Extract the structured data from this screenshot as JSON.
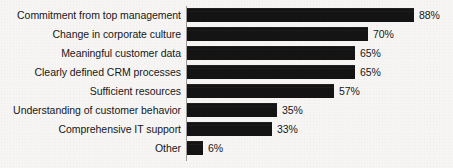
{
  "chart": {
    "title": "",
    "background_color": "#f6f5f3",
    "bar_color": "#141414",
    "text_color": "#17171a",
    "axis_color": "#9b9a98"
  },
  "chart_data": {
    "type": "bar",
    "orientation": "horizontal",
    "title": "",
    "subtitle": "",
    "xlabel": "",
    "ylabel": "",
    "xlim": [
      0,
      100
    ],
    "grid": false,
    "legend": false,
    "value_suffix": "%",
    "categories": [
      "Commitment from top management",
      "Change in corporate culture",
      "Meaningful customer data",
      "Clearly defined CRM processes",
      "Sufficient resources",
      "Understanding of customer behavior",
      "Comprehensive IT support",
      "Other"
    ],
    "values": [
      88,
      70,
      65,
      65,
      57,
      35,
      33,
      6
    ],
    "value_labels": [
      "88%",
      "70%",
      "65%",
      "65%",
      "57%",
      "35%",
      "33%",
      "6%"
    ]
  }
}
